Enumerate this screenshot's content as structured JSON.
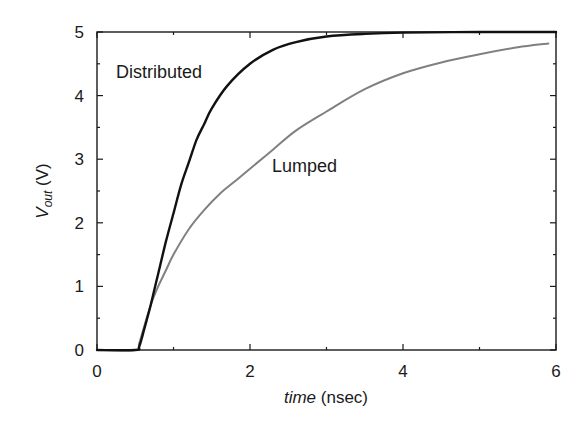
{
  "chart_data": {
    "type": "line",
    "title": "",
    "xlabel": "time (nsec)",
    "xlabel_italic_part": "time",
    "xlabel_unit_part": "(nsec)",
    "ylabel": "V_out (V)",
    "ylabel_main": "V",
    "ylabel_sub": "out",
    "ylabel_unit": "(V)",
    "xlim": [
      0,
      6
    ],
    "ylim": [
      0,
      5
    ],
    "xticks": [
      0,
      2,
      4,
      6
    ],
    "xticks_minor": [
      1,
      3,
      5
    ],
    "yticks": [
      0,
      1,
      2,
      3,
      4,
      5
    ],
    "yticks_minor": [
      0.5,
      1.5,
      2.5,
      3.5,
      4.5
    ],
    "grid": false,
    "legend": "inline annotations",
    "series": [
      {
        "name": "Distributed",
        "color": "#111111",
        "points": [
          [
            0,
            0
          ],
          [
            0.5,
            0
          ],
          [
            0.55,
            0.05
          ],
          [
            0.6,
            0.25
          ],
          [
            0.7,
            0.7
          ],
          [
            0.8,
            1.2
          ],
          [
            0.9,
            1.7
          ],
          [
            1.0,
            2.15
          ],
          [
            1.1,
            2.6
          ],
          [
            1.2,
            2.95
          ],
          [
            1.3,
            3.3
          ],
          [
            1.4,
            3.55
          ],
          [
            1.5,
            3.8
          ],
          [
            1.7,
            4.15
          ],
          [
            2.0,
            4.5
          ],
          [
            2.3,
            4.72
          ],
          [
            2.6,
            4.84
          ],
          [
            3.0,
            4.93
          ],
          [
            3.5,
            4.97
          ],
          [
            4.0,
            4.99
          ],
          [
            5.0,
            5.0
          ],
          [
            6.0,
            5.0
          ]
        ]
      },
      {
        "name": "Lumped",
        "color": "#808080",
        "points": [
          [
            0,
            0
          ],
          [
            0.5,
            0
          ],
          [
            0.55,
            0.1
          ],
          [
            0.6,
            0.3
          ],
          [
            0.7,
            0.7
          ],
          [
            0.8,
            1.0
          ],
          [
            0.9,
            1.25
          ],
          [
            1.0,
            1.5
          ],
          [
            1.2,
            1.9
          ],
          [
            1.4,
            2.2
          ],
          [
            1.6,
            2.45
          ],
          [
            1.8,
            2.65
          ],
          [
            2.0,
            2.85
          ],
          [
            2.3,
            3.15
          ],
          [
            2.6,
            3.45
          ],
          [
            3.0,
            3.75
          ],
          [
            3.5,
            4.1
          ],
          [
            4.0,
            4.35
          ],
          [
            4.5,
            4.52
          ],
          [
            5.0,
            4.65
          ],
          [
            5.5,
            4.76
          ],
          [
            5.9,
            4.82
          ]
        ]
      }
    ],
    "annotations": [
      {
        "text": "Distributed",
        "x": 0.25,
        "y": 4.4
      },
      {
        "text": "Lumped",
        "x": 2.3,
        "y": 2.85
      }
    ]
  },
  "labels": {
    "x_ticks": [
      "0",
      "2",
      "4",
      "6"
    ],
    "y_ticks": [
      "0",
      "1",
      "2",
      "3",
      "4",
      "5"
    ],
    "distributed": "Distributed",
    "lumped": "Lumped",
    "x_italic": "time",
    "x_unit": " (nsec)",
    "y_main": "V",
    "y_sub": "out",
    "y_unit": " (V)"
  }
}
